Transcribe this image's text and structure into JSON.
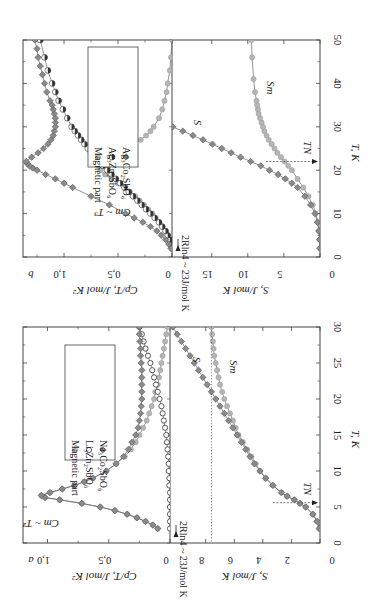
{
  "figure": {
    "orientation": "rotated 90 degrees clockwise",
    "panels": [
      "a",
      "b"
    ]
  },
  "chart_data": [
    {
      "panel": "b",
      "type": "scatter",
      "subplots": [
        {
          "ylabel": "Cp/T, J/mol K²",
          "yticks": [
            "0",
            "0,5",
            "1,0"
          ],
          "ylim": [
            0,
            1.38
          ],
          "legend": [
            "Ag₃Co₂SbO₆",
            "Ag₃Zn₂SbO₆",
            "Magnetic part"
          ],
          "annotations": [
            "Cm ~ T³"
          ],
          "series": [
            {
              "name": "Ag₃Co₂SbO₆",
              "marker": "diamond-gray",
              "x": [
                2,
                3,
                4,
                5,
                6,
                7,
                8,
                9,
                10,
                12,
                14,
                16,
                17,
                18,
                19,
                20,
                20.5,
                21,
                21.5,
                22,
                23,
                24,
                25,
                26,
                27,
                28,
                29,
                30,
                31,
                32,
                33,
                34,
                35,
                36,
                38,
                40,
                42,
                44,
                46,
                48,
                50
              ],
              "y": [
                0.01,
                0.03,
                0.06,
                0.1,
                0.14,
                0.2,
                0.27,
                0.35,
                0.43,
                0.58,
                0.75,
                0.92,
                1.0,
                1.08,
                1.17,
                1.25,
                1.29,
                1.32,
                1.34,
                1.35,
                1.3,
                1.24,
                1.19,
                1.15,
                1.12,
                1.1,
                1.09,
                1.08,
                1.08,
                1.08,
                1.09,
                1.1,
                1.11,
                1.13,
                1.16,
                1.18,
                1.2,
                1.22,
                1.24,
                1.25,
                1.27
              ]
            },
            {
              "name": "Ag₃Zn₂SbO₆",
              "marker": "half-filled-circle",
              "x": [
                2,
                3,
                4,
                5,
                6,
                7,
                8,
                9,
                10,
                11,
                12,
                13,
                14,
                15,
                16,
                17,
                18,
                19,
                20,
                21,
                22,
                23,
                24,
                25,
                26,
                27,
                28,
                29,
                30,
                32,
                34,
                36,
                38,
                40,
                43,
                46,
                50
              ],
              "y": [
                0.0,
                0.01,
                0.02,
                0.04,
                0.06,
                0.09,
                0.12,
                0.16,
                0.2,
                0.24,
                0.28,
                0.32,
                0.36,
                0.4,
                0.44,
                0.48,
                0.52,
                0.56,
                0.6,
                0.64,
                0.68,
                0.72,
                0.75,
                0.78,
                0.81,
                0.84,
                0.87,
                0.9,
                0.93,
                0.97,
                1.01,
                1.05,
                1.08,
                1.11,
                1.15,
                1.18,
                1.22
              ]
            },
            {
              "name": "Magnetic part",
              "marker": "circle-lightgray",
              "x": [
                2,
                3,
                4,
                5,
                6,
                7,
                8,
                9,
                10,
                11,
                12,
                13,
                14,
                15,
                16,
                17,
                18,
                19,
                20,
                21,
                22,
                23,
                24,
                25,
                26,
                27,
                28,
                29,
                30,
                32,
                34,
                36,
                38,
                40,
                43,
                46,
                50
              ],
              "y": [
                0.0,
                0.01,
                0.02,
                0.04,
                0.06,
                0.09,
                0.12,
                0.15,
                0.18,
                0.22,
                0.26,
                0.3,
                0.34,
                0.39,
                0.44,
                0.5,
                0.56,
                0.62,
                0.66,
                0.68,
                0.67,
                0.6,
                0.5,
                0.42,
                0.35,
                0.29,
                0.24,
                0.2,
                0.17,
                0.12,
                0.09,
                0.07,
                0.05,
                0.04,
                0.02,
                0.01,
                0.0
              ]
            }
          ]
        },
        {
          "ylabel": "S, J/mol K",
          "yticks": [
            "0",
            "5",
            "10",
            "15"
          ],
          "ylim": [
            0,
            20.5
          ],
          "annotations": [
            "2Rln4 ~ 23J/mol K",
            "S",
            "Sm",
            "TN"
          ],
          "TN": 22,
          "series": [
            {
              "name": "S",
              "marker": "diamond-gray",
              "x": [
                2,
                4,
                6,
                8,
                10,
                12,
                14,
                16,
                17,
                18,
                19,
                20,
                21,
                22,
                23,
                24,
                25,
                26,
                27,
                28,
                29,
                30
              ],
              "y": [
                0.0,
                0.05,
                0.15,
                0.35,
                0.7,
                1.3,
                2.1,
                3.1,
                3.9,
                4.8,
                5.8,
                7.0,
                8.2,
                9.6,
                11.0,
                12.3,
                13.6,
                14.9,
                16.2,
                17.6,
                19.0,
                20.4
              ]
            },
            {
              "name": "Sm",
              "marker": "circle-lightgray",
              "x": [
                2,
                4,
                6,
                8,
                10,
                12,
                14,
                16,
                18,
                20,
                21,
                22,
                23,
                24,
                25,
                26,
                27,
                28,
                29,
                30,
                31,
                32,
                33,
                34,
                35,
                36,
                38,
                41,
                46,
                50
              ],
              "y": [
                0.0,
                0.05,
                0.15,
                0.3,
                0.6,
                1.0,
                1.6,
                2.3,
                3.1,
                3.9,
                4.4,
                4.9,
                5.4,
                5.9,
                6.3,
                6.7,
                7.1,
                7.4,
                7.7,
                7.9,
                8.1,
                8.3,
                8.5,
                8.6,
                8.7,
                8.8,
                9.0,
                9.2,
                9.4,
                9.5
              ]
            }
          ]
        }
      ],
      "xlabel": "T, K",
      "xticks": [
        "0",
        "10",
        "20",
        "30",
        "40",
        "50"
      ],
      "xlim": [
        0,
        50
      ]
    },
    {
      "panel": "a",
      "type": "scatter",
      "subplots": [
        {
          "ylabel": "Cp/T, J/mol K²",
          "yticks": [
            "0",
            "0,5",
            "1,0"
          ],
          "ylim": [
            0,
            1.2
          ],
          "legend": [
            "Na₃Co₂SbO₆",
            "Li₃Zn₂SbO₆",
            "Magnetic part"
          ],
          "annotations": [
            "Cm ~ T²"
          ],
          "series": [
            {
              "name": "Na₃Co₂SbO₆",
              "marker": "diamond-gray",
              "x": [
                2,
                2.5,
                3,
                3.5,
                4,
                4.5,
                5,
                5.5,
                6,
                6.3,
                6.6,
                7,
                7.5,
                8,
                8.5,
                9,
                10,
                11,
                12,
                13,
                14,
                15,
                16,
                17,
                18,
                19,
                20,
                21,
                22,
                23,
                24,
                25,
                26,
                27,
                28,
                29,
                30
              ],
              "y": [
                0.1,
                0.14,
                0.2,
                0.27,
                0.35,
                0.45,
                0.57,
                0.72,
                0.9,
                1.02,
                1.05,
                0.98,
                0.88,
                0.78,
                0.7,
                0.63,
                0.52,
                0.44,
                0.38,
                0.34,
                0.31,
                0.28,
                0.26,
                0.25,
                0.24,
                0.235,
                0.23,
                0.23,
                0.23,
                0.23,
                0.23,
                0.235,
                0.24,
                0.24,
                0.245,
                0.25,
                0.25
              ]
            },
            {
              "name": "Li₃Zn₂SbO₆",
              "marker": "open-circle",
              "x": [
                2,
                3,
                4,
                5,
                6,
                7,
                8,
                9,
                10,
                11,
                12,
                13,
                14,
                15,
                16,
                17,
                18,
                19,
                20,
                21,
                22,
                23,
                24,
                25,
                26,
                27,
                28,
                29,
                30
              ],
              "y": [
                0.0,
                0.0,
                0.0,
                0.0,
                0.0,
                0.0,
                0.005,
                0.005,
                0.01,
                0.01,
                0.015,
                0.02,
                0.025,
                0.03,
                0.04,
                0.05,
                0.06,
                0.07,
                0.085,
                0.1,
                0.115,
                0.13,
                0.145,
                0.16,
                0.18,
                0.2,
                0.215,
                0.23,
                0.25
              ]
            },
            {
              "name": "Magnetic part",
              "marker": "circle-lightgray",
              "x": [
                2,
                2.5,
                3,
                3.5,
                4,
                4.5,
                5,
                5.5,
                6,
                6.3,
                6.6,
                7,
                7.5,
                8,
                8.5,
                9,
                10,
                11,
                12,
                13,
                14,
                15,
                16,
                17,
                18,
                19,
                20,
                21,
                22,
                23,
                24,
                25,
                26,
                27,
                28,
                29,
                30
              ],
              "y": [
                0.1,
                0.14,
                0.2,
                0.27,
                0.35,
                0.45,
                0.57,
                0.72,
                0.9,
                1.02,
                1.05,
                0.98,
                0.88,
                0.78,
                0.7,
                0.63,
                0.52,
                0.44,
                0.37,
                0.32,
                0.28,
                0.25,
                0.22,
                0.19,
                0.17,
                0.15,
                0.13,
                0.12,
                0.1,
                0.09,
                0.08,
                0.07,
                0.06,
                0.05,
                0.04,
                0.03,
                0.02
              ]
            }
          ]
        },
        {
          "ylabel": "S, J/mol K",
          "yticks": [
            "0",
            "2",
            "4",
            "6",
            "8"
          ],
          "ylim": [
            0,
            10.5
          ],
          "annotations": [
            "2Rln4 ~ 23J/mol K",
            "S",
            "Sm",
            "TN"
          ],
          "TN": 5.6,
          "hline_S": 7.6,
          "series": [
            {
              "name": "S",
              "marker": "diamond-gray",
              "x": [
                2,
                3,
                4,
                5,
                5.5,
                6,
                6.5,
                7,
                8,
                9,
                10,
                11,
                12,
                13,
                14,
                15,
                16,
                17,
                18,
                19,
                20,
                21,
                22,
                23,
                24,
                25,
                26,
                27,
                28,
                29,
                30
              ],
              "y": [
                0.05,
                0.2,
                0.5,
                1.0,
                1.4,
                1.8,
                2.3,
                2.7,
                3.3,
                3.8,
                4.2,
                4.6,
                4.9,
                5.2,
                5.5,
                5.8,
                6.1,
                6.4,
                6.7,
                7.0,
                7.3,
                7.6,
                7.9,
                8.2,
                8.5,
                8.8,
                9.1,
                9.4,
                9.7,
                10.0,
                10.3
              ]
            },
            {
              "name": "Sm",
              "marker": "circle-lightgray",
              "x": [
                2,
                3,
                4,
                5,
                5.5,
                6,
                6.5,
                7,
                8,
                9,
                10,
                11,
                12,
                13,
                14,
                15,
                16,
                17,
                18,
                19,
                20,
                21,
                22,
                23,
                24,
                25,
                26,
                27,
                28,
                29,
                30
              ],
              "y": [
                0.05,
                0.2,
                0.5,
                1.0,
                1.4,
                1.8,
                2.3,
                2.7,
                3.3,
                3.8,
                4.2,
                4.5,
                4.8,
                5.1,
                5.4,
                5.7,
                5.9,
                6.1,
                6.3,
                6.5,
                6.7,
                6.85,
                7.0,
                7.1,
                7.2,
                7.3,
                7.4,
                7.45,
                7.5,
                7.55,
                7.6
              ]
            }
          ]
        }
      ],
      "xlabel": "T, K",
      "xticks": [
        "0",
        "5",
        "10",
        "15",
        "20",
        "25",
        "30"
      ],
      "xlim": [
        0,
        30
      ]
    }
  ],
  "labels": {
    "panel_a": "a",
    "panel_b": "b",
    "xlabel": "T, K",
    "ylabel_cp": "Cp/T, J/mol K²",
    "ylabel_s": "S, J/mol K",
    "annot_2rln4": "2Rln4 ~ 23J/mol K",
    "annot_S": "S",
    "annot_Sm": "Sm",
    "annot_TN": "TN",
    "annot_cm_b": "Cm ~ T³",
    "annot_cm_a": "Cm ~ T²"
  },
  "colors": {
    "frame": "#444444",
    "diamond": "#8a8a8a",
    "diamond_edge": "#555555",
    "magnetic": "#b5b5b5",
    "magnetic_edge": "#999999",
    "half_dark": "#333333",
    "open_edge": "#333333",
    "line": "#666666"
  }
}
